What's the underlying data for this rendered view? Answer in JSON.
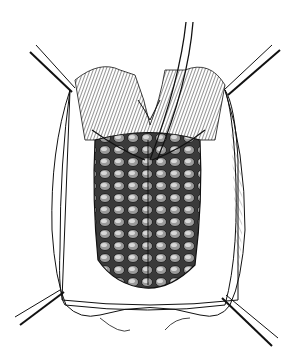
{
  "illustration": {
    "subject": "surgical-field-line-drawing",
    "style": "black-ink-hatching",
    "background_color": "#ffffff",
    "ink_color": "#111111",
    "elements": {
      "retractors": 4,
      "central_instrument": 1,
      "drape": "rectangular-drape-with-opening",
      "exposed_tissue": "lobulated-tissue-oval"
    }
  }
}
